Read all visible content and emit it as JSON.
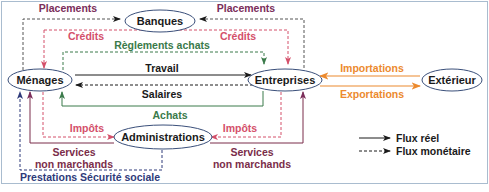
{
  "nodes": {
    "banques": "Banques",
    "menages": "Ménages",
    "entreprises": "Entreprises",
    "exterieur": "Extérieur",
    "administrations": "Administrations"
  },
  "flows": {
    "placements_left": "Placements",
    "placements_right": "Placements",
    "credits_left": "Crédits",
    "credits_right": "Crédits",
    "reglements_achats": "Règlements achats",
    "travail": "Travail",
    "salaires": "Salaires",
    "achats": "Achats",
    "importations": "Importations",
    "exportations": "Exportations",
    "impots_left": "Impôts",
    "impots_right": "Impôts",
    "services_left_1": "Services",
    "services_left_2": "non marchands",
    "services_right_1": "Services",
    "services_right_2": "non marchands",
    "prestations": "Prestations Sécurité sociale"
  },
  "legend": {
    "real": "Flux réel",
    "monetary": "Flux monétaire"
  },
  "colors": {
    "placements": "#7b2d5a",
    "credits": "#d4506a",
    "reglements": "#3a7a4a",
    "real": "#1a1a1a",
    "trade": "#ec8a2e",
    "impots": "#d4506a",
    "services": "#7b2d4a",
    "prestations": "#2e3a7a",
    "node_border": "#3a4f7a"
  }
}
